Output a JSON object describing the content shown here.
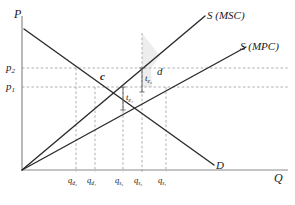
{
  "figure": {
    "type": "economics-supply-demand-externality-diagram",
    "background": "#ffffff",
    "width": 295,
    "height": 205
  },
  "axes": {
    "y_axis_label": "P",
    "x_axis_label": "Q",
    "axis_color": "#8a8a8a",
    "origin": {
      "x": 22,
      "y": 170
    }
  },
  "curves": [
    {
      "name": "supply-msc",
      "label": "S (MSC)",
      "label_main": "S",
      "label_paren": "(MSC)",
      "color": "#2b2b2b",
      "from": {
        "x": 22,
        "y": 170
      },
      "to": {
        "x": 205,
        "y": 16
      }
    },
    {
      "name": "supply-mpc",
      "label": "S (MPC)",
      "label_main": "S",
      "label_paren": "(MPC)",
      "color": "#2b2b2b",
      "from": {
        "x": 22,
        "y": 170
      },
      "to": {
        "x": 245,
        "y": 47
      }
    },
    {
      "name": "demand",
      "label": "D",
      "color": "#2b2b2b",
      "from": {
        "x": 24,
        "y": 29
      },
      "to": {
        "x": 215,
        "y": 166
      }
    }
  ],
  "price_levels": [
    {
      "name": "p2",
      "label_main": "p",
      "label_sub": "2",
      "y": 68
    },
    {
      "name": "p1",
      "label_main": "p",
      "label_sub": "1",
      "y": 87
    }
  ],
  "quantity_ticks": [
    {
      "name": "qd2",
      "label_main": "q",
      "label_sub": "d₂",
      "x": 76
    },
    {
      "name": "qd1",
      "label_main": "q",
      "label_sub": "d₁",
      "x": 95
    },
    {
      "name": "qs2",
      "label_main": "q",
      "label_sub": "s₂",
      "x": 123
    },
    {
      "name": "qs2p",
      "label_main": "q",
      "label_sub": "s₂",
      "x": 142
    },
    {
      "name": "qs1",
      "label_main": "q",
      "label_sub": "s₁",
      "x": 166
    }
  ],
  "shaded_areas": [
    {
      "name": "area-c",
      "label": "c",
      "fill": "#7f7f7f",
      "description": "dark grey trapezoid between p1 and p2 bounded by demand and MSC supply"
    },
    {
      "name": "area-d",
      "label": "d",
      "fill": "#e2e2e2",
      "description": "light grey sliver right of the dark trapezoid between MSC and MPC"
    }
  ],
  "tax_brackets": [
    {
      "name": "t-e1",
      "label_main": "t",
      "label_sub": "e₁"
    },
    {
      "name": "t-e2",
      "label_main": "t",
      "label_sub": "e₂"
    }
  ],
  "gridlines": {
    "color": "#9a9a9a",
    "style": "dashed"
  }
}
